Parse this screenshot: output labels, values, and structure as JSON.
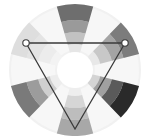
{
  "diagram": {
    "type": "color-wheel-triadic-scheme",
    "rendering": "grayscale",
    "center": [
      75,
      70
    ],
    "outer_radius": 66,
    "inner_white_radius": 14,
    "background_ring_color": "#f1f1f1",
    "center_color": "#ffffff",
    "spokes": [
      {
        "name": "top",
        "angle": -90,
        "shades": [
          "#e6e6e6",
          "#c2c2c2",
          "#9a9a9a",
          "#6e6e6e"
        ]
      },
      {
        "name": "upper-right",
        "angle": -30,
        "shades": [
          "#e8e8e8",
          "#c8c8c8",
          "#a4a4a4",
          "#7c7c7c"
        ]
      },
      {
        "name": "lower-right",
        "angle": 30,
        "shades": [
          "#d4d4d4",
          "#a0a0a0",
          "#5a5a5a",
          "#2a2a2a"
        ]
      },
      {
        "name": "bottom",
        "angle": 90,
        "shades": [
          "#eeeeee",
          "#d6d6d6",
          "#bdbdbd",
          "#a8a8a8"
        ]
      },
      {
        "name": "lower-left",
        "angle": 150,
        "shades": [
          "#ededed",
          "#cfcfcf",
          "#9c9c9c",
          "#7a7a7a"
        ]
      },
      {
        "name": "upper-left",
        "angle": 210,
        "shades": [
          "#f3f3f3",
          "#ececec",
          "#e4e4e4",
          "#dedede"
        ]
      }
    ],
    "faint_sectors_color": "#f7f7f7",
    "triangle": {
      "stroke": "#3a3a3a",
      "vertices": [
        [
          26,
          43
        ],
        [
          125,
          43
        ],
        [
          75,
          129
        ]
      ],
      "marker_vertices": [
        [
          26,
          43
        ],
        [
          125,
          43
        ]
      ],
      "marker_radius": 3.2
    }
  }
}
